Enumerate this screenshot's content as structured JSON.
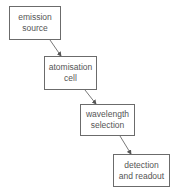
{
  "diagram": {
    "type": "flowchart",
    "direction": "diagonal-down-right",
    "nodes": [
      {
        "id": "n1",
        "line1": "emission",
        "line2": "source"
      },
      {
        "id": "n2",
        "line1": "atomisation",
        "line2": "cell"
      },
      {
        "id": "n3",
        "line1": "wavelength",
        "line2": "selection"
      },
      {
        "id": "n4",
        "line1": "detection",
        "line2": "and readout"
      }
    ],
    "edges": [
      {
        "from": "n1",
        "to": "n2"
      },
      {
        "from": "n2",
        "to": "n3"
      },
      {
        "from": "n3",
        "to": "n4"
      }
    ],
    "colors": {
      "border": "#6b6b6b",
      "text": "#555555",
      "arrow": "#555555"
    }
  }
}
